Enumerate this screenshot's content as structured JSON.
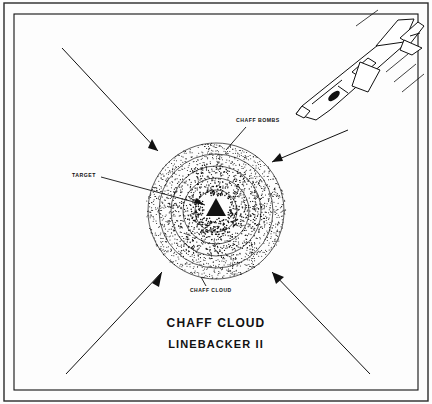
{
  "figure": {
    "title": "CHAFF CLOUD",
    "subtitle": "LINEBACKER II",
    "labels": {
      "chaff_bombs": "CHAFF BOMBS",
      "target": "TARGET",
      "chaff_cloud": "CHAFF CLOUD"
    },
    "colors": {
      "ink": "#111111",
      "background": "#ffffff",
      "border": "#000000"
    },
    "elements": {
      "target_marker": "triangle",
      "aircraft": "fighter-jet",
      "cloud": "stippled-chaff-cloud",
      "approach_arrows": 4
    }
  }
}
